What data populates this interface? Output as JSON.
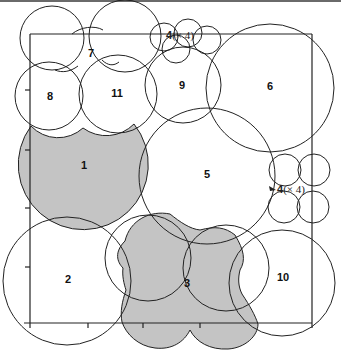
{
  "figure": {
    "type": "circle-covering-diagram",
    "frame": {
      "left": 30,
      "top": 34,
      "right": 312,
      "bottom": 323
    },
    "shaded_color": "#c4c4c4",
    "line_color": "#222222",
    "y_ticks": [
      90,
      150,
      208,
      267
    ],
    "x_ticks": [
      88,
      143,
      200
    ],
    "regions": [
      {
        "id": "1",
        "label": "1",
        "shaded": true,
        "label_pos": [
          84,
          166
        ]
      },
      {
        "id": "2",
        "label": "2",
        "shaded": false,
        "label_pos": [
          68,
          280
        ]
      },
      {
        "id": "3",
        "label": "3",
        "shaded": true,
        "label_pos": [
          187,
          283
        ]
      },
      {
        "id": "4a",
        "label": "4",
        "multiplier": "(× 4)",
        "shaded": false,
        "label_pos": [
          168,
          36
        ]
      },
      {
        "id": "4b",
        "label": "4",
        "multiplier": "(× 4)",
        "shaded": false,
        "label_pos": [
          277,
          190
        ]
      },
      {
        "id": "5",
        "label": "5",
        "shaded": false,
        "label_pos": [
          207,
          174
        ]
      },
      {
        "id": "6",
        "label": "6",
        "shaded": false,
        "label_pos": [
          270,
          87
        ]
      },
      {
        "id": "7",
        "label": "7",
        "shaded": false,
        "label_pos": [
          91,
          53
        ]
      },
      {
        "id": "8",
        "label": "8",
        "shaded": false,
        "label_pos": [
          50,
          97
        ]
      },
      {
        "id": "9",
        "label": "9",
        "shaded": false,
        "label_pos": [
          182,
          85
        ]
      },
      {
        "id": "10",
        "label": "10",
        "shaded": false,
        "label_pos": [
          282,
          277
        ]
      },
      {
        "id": "11",
        "label": "11",
        "shaded": false,
        "label_pos": [
          117,
          94
        ]
      }
    ]
  },
  "labels": {
    "r1": "1",
    "r2": "2",
    "r3": "3",
    "r4_top_num": "4",
    "r4_top_mult": "(× 4)",
    "r4_right_num": "4",
    "r4_right_mult": "(× 4)",
    "r5": "5",
    "r6": "6",
    "r7": "7",
    "r8": "8",
    "r9": "9",
    "r10": "10",
    "r11": "11"
  }
}
